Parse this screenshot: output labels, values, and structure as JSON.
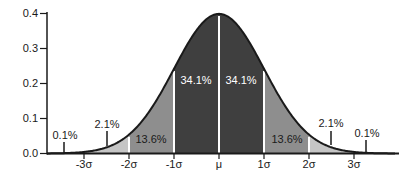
{
  "chart_data": {
    "type": "area",
    "distribution": "standard normal probability density",
    "grid": false,
    "legend": "none",
    "xlim_sigma": [
      -3.82,
      4.0
    ],
    "ylim": [
      0.0,
      0.4
    ],
    "y_ticks": [
      "0.0",
      "0.1",
      "0.2",
      "0.3",
      "0.4"
    ],
    "y_tick_values": [
      0.0,
      0.1,
      0.2,
      0.3,
      0.4
    ],
    "x_ticks": [
      "-3σ",
      "-2σ",
      "-1σ",
      "μ",
      "1σ",
      "2σ",
      "3σ"
    ],
    "x_tick_values": [
      -3,
      -2,
      -1,
      0,
      1,
      2,
      3
    ],
    "peak_density": 0.3989,
    "regions": [
      {
        "from": -4.0,
        "to": -3.0,
        "percent": "0.1%",
        "color": "#dcdcdc"
      },
      {
        "from": -3.0,
        "to": -2.0,
        "percent": "2.1%",
        "color": "#c5c5c5"
      },
      {
        "from": -2.0,
        "to": -1.0,
        "percent": "13.6%",
        "color": "#8e8e8e"
      },
      {
        "from": -1.0,
        "to": 0.0,
        "percent": "34.1%",
        "color": "#3f3f3f"
      },
      {
        "from": 0.0,
        "to": 1.0,
        "percent": "34.1%",
        "color": "#3f3f3f"
      },
      {
        "from": 1.0,
        "to": 2.0,
        "percent": "13.6%",
        "color": "#8e8e8e"
      },
      {
        "from": 2.0,
        "to": 3.0,
        "percent": "2.1%",
        "color": "#c5c5c5"
      },
      {
        "from": 3.0,
        "to": 4.0,
        "percent": "0.1%",
        "color": "#dcdcdc"
      }
    ],
    "separators_sigma": [
      -2,
      -1,
      0,
      1,
      2
    ],
    "colors": {
      "curve": "#1a1a1a",
      "axis": "#1a1a1a",
      "separator": "#ffffff",
      "label_dark": "#1a1a1a",
      "label_light": "#ffffff",
      "background": "#ffffff"
    }
  }
}
